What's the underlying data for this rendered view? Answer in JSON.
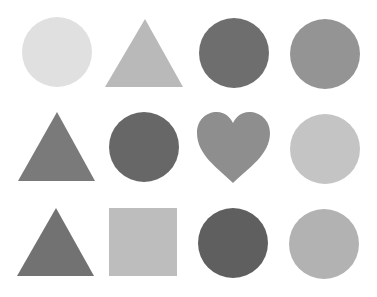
{
  "canvas": {
    "width": 377,
    "height": 297,
    "background": "#ffffff"
  },
  "shapes": [
    {
      "row": 1,
      "col": 1,
      "type": "circle",
      "cx": 57,
      "cy": 52,
      "r": 35,
      "color": "#e0e0e0"
    },
    {
      "row": 1,
      "col": 2,
      "type": "triangle",
      "points": "145,19 105,87 183,87",
      "color": "#b9b9b9"
    },
    {
      "row": 1,
      "col": 3,
      "type": "circle",
      "cx": 234,
      "cy": 53,
      "r": 35,
      "color": "#6e6e6e"
    },
    {
      "row": 1,
      "col": 4,
      "type": "circle",
      "cx": 325,
      "cy": 54,
      "r": 35,
      "color": "#949494"
    },
    {
      "row": 2,
      "col": 1,
      "type": "triangle",
      "points": "57,112 18,181 95,181",
      "color": "#7a7a7a"
    },
    {
      "row": 2,
      "col": 2,
      "type": "circle",
      "cx": 144,
      "cy": 147,
      "r": 35,
      "color": "#676767"
    },
    {
      "row": 2,
      "col": 3,
      "type": "heart",
      "color": "#8e8e8e"
    },
    {
      "row": 2,
      "col": 4,
      "type": "circle",
      "cx": 325,
      "cy": 149,
      "r": 35,
      "color": "#c4c4c4"
    },
    {
      "row": 3,
      "col": 1,
      "type": "triangle",
      "points": "56,208 17,276 94,276",
      "color": "#727272"
    },
    {
      "row": 3,
      "col": 2,
      "type": "square",
      "x": 109,
      "y": 208,
      "w": 68,
      "h": 68,
      "color": "#bdbdbd"
    },
    {
      "row": 3,
      "col": 3,
      "type": "circle",
      "cx": 233,
      "cy": 243,
      "r": 35,
      "color": "#5f5f5f"
    },
    {
      "row": 3,
      "col": 4,
      "type": "circle",
      "cx": 324,
      "cy": 244,
      "r": 35,
      "color": "#b2b2b2"
    }
  ]
}
